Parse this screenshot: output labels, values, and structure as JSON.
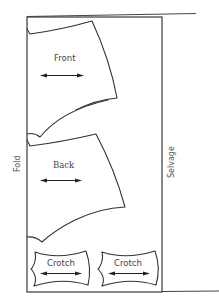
{
  "diagram": {
    "edges": {
      "fold_label": "Fold",
      "selvage_label": "Selvage"
    },
    "pieces": [
      {
        "id": "front",
        "label": "Front",
        "grainline": "horizontal double arrow"
      },
      {
        "id": "back",
        "label": "Back",
        "grainline": "horizontal double arrow"
      },
      {
        "id": "crotch-1",
        "label": "Crotch",
        "grainline": "horizontal double arrow"
      },
      {
        "id": "crotch-2",
        "label": "Crotch",
        "grainline": "horizontal double arrow"
      }
    ],
    "colors": {
      "line": "#333333",
      "text": "#444444",
      "background": "#ffffff"
    }
  }
}
